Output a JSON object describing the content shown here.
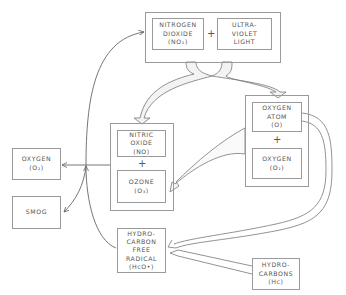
{
  "diagram": {
    "type": "photochemical smog reaction cycle",
    "nodes": {
      "nitrogen_dioxide": {
        "lines": [
          "NITROGEN",
          "DIOXIDE",
          "(NO₂)"
        ]
      },
      "ultraviolet_light": {
        "lines": [
          "ULTRA-",
          "VIOLET",
          "LIGHT"
        ]
      },
      "nitric_oxide": {
        "lines": [
          "NITRIC",
          "OXIDE",
          "(NO)"
        ]
      },
      "ozone": {
        "lines": [
          "OZONE",
          "(O₃)"
        ]
      },
      "oxygen_atom": {
        "lines": [
          "OXYGEN",
          "ATOM",
          "(O)"
        ]
      },
      "oxygen_molecule_right": {
        "lines": [
          "OXYGEN",
          "(O₂)"
        ]
      },
      "oxygen_molecule_left": {
        "lines": [
          "OXYGEN",
          "(O₂)"
        ]
      },
      "smog": {
        "lines": [
          "SMOG"
        ]
      },
      "hydrocarbon_free_radical": {
        "lines": [
          "HYDRO-",
          "CARBON",
          "FREE",
          "RADICAL",
          "(HᴄO•)"
        ]
      },
      "hydrocarbons": {
        "lines": [
          "HYDRO-",
          "CARBONS",
          "(Hᴄ)"
        ]
      }
    },
    "operators": {
      "top_plus": "+",
      "middle_plus": "+",
      "right_plus": "+"
    },
    "edges": [
      {
        "from": "nitrogen_dioxide + ultraviolet_light",
        "to": "nitric_oxide + ozone",
        "style": "wide-arrow"
      },
      {
        "from": "nitrogen_dioxide + ultraviolet_light",
        "to": "oxygen_atom + oxygen_molecule_right",
        "style": "wide-arrow"
      },
      {
        "from": "oxygen_atom + oxygen_molecule_right",
        "to": "ozone",
        "style": "wide-arrow"
      },
      {
        "from": "oxygen_atom",
        "to": "hydrocarbon_free_radical",
        "style": "wide-arrow"
      },
      {
        "from": "hydrocarbons",
        "to": "hydrocarbon_free_radical",
        "style": "wide-arrow"
      },
      {
        "from": "nitric_oxide + ozone",
        "to": "oxygen_molecule_left",
        "style": "thin-arrow"
      },
      {
        "from": "hydrocarbon_free_radical",
        "to": "junction",
        "style": "thin-arrow"
      },
      {
        "from": "junction",
        "to": "smog",
        "style": "thin-arrow"
      },
      {
        "from": "junction",
        "to": "nitrogen_dioxide",
        "style": "thin-arrow"
      }
    ],
    "colors": {
      "line": "#7a7a7a",
      "text": "#555555",
      "background": "#ffffff"
    }
  }
}
